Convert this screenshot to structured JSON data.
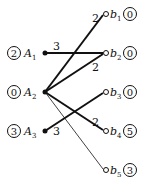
{
  "diagram": {
    "type": "bipartite-graph",
    "left_nodes": [
      {
        "id": "A1",
        "name": "A",
        "sub": "1",
        "label": "2",
        "x": 45,
        "y": 53
      },
      {
        "id": "A2",
        "name": "A",
        "sub": "2",
        "label": "0",
        "x": 45,
        "y": 92
      },
      {
        "id": "A3",
        "name": "A",
        "sub": "3",
        "label": "3",
        "x": 45,
        "y": 131
      }
    ],
    "right_nodes": [
      {
        "id": "b1",
        "name": "b",
        "sub": "1",
        "label": "0",
        "x": 105,
        "y": 14
      },
      {
        "id": "b2",
        "name": "b",
        "sub": "2",
        "label": "0",
        "x": 105,
        "y": 53
      },
      {
        "id": "b3",
        "name": "b",
        "sub": "3",
        "label": "0",
        "x": 105,
        "y": 92
      },
      {
        "id": "b4",
        "name": "b",
        "sub": "4",
        "label": "5",
        "x": 105,
        "y": 131
      },
      {
        "id": "b5",
        "name": "b",
        "sub": "5",
        "label": "3",
        "x": 105,
        "y": 170
      }
    ],
    "edges": [
      {
        "from": "A1",
        "to": "b2",
        "weight": "3",
        "bold": true
      },
      {
        "from": "A2",
        "to": "b1",
        "weight": "2",
        "bold": true
      },
      {
        "from": "A2",
        "to": "b2",
        "weight": "2",
        "bold": true
      },
      {
        "from": "A2",
        "to": "b4",
        "weight": "2",
        "bold": true
      },
      {
        "from": "A3",
        "to": "b3",
        "weight": "3",
        "bold": true
      },
      {
        "from": "A2",
        "to": "b5",
        "weight": "",
        "bold": false
      }
    ]
  }
}
